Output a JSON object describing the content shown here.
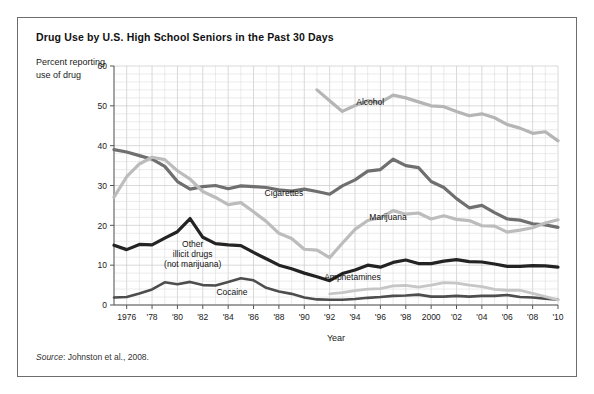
{
  "figure": {
    "title": "Drug Use by U.S. High School Seniors in the Past 30 Days",
    "y_caption": "Percent reporting use of drug",
    "source_prefix": "Source",
    "source_text": ": Johnston et al., 2008."
  },
  "chart_data": {
    "type": "line",
    "title": "Drug Use by U.S. High School Seniors in the Past 30 Days",
    "xlabel": "Year",
    "ylabel": "Percent reporting use of drug",
    "xlim": [
      1975,
      2010
    ],
    "ylim": [
      0,
      60
    ],
    "ytick_step": 10,
    "yticks": [
      0,
      10,
      20,
      30,
      40,
      50,
      60
    ],
    "xticks": [
      1976,
      1978,
      1980,
      1982,
      1984,
      1986,
      1988,
      1990,
      1992,
      1994,
      1996,
      1998,
      2000,
      2002,
      2004,
      2006,
      2008,
      2010
    ],
    "xtick_labels": [
      "1976",
      "'78",
      "'80",
      "'82",
      "'84",
      "'86",
      "'88",
      "'90",
      "'92",
      "'94",
      "'96",
      "'98",
      "2000",
      "'02",
      "'04",
      "'06",
      "'08",
      "'10"
    ],
    "grid": true,
    "grid_minor_x": true,
    "grid_minor_y": true,
    "legend": "inline-labels",
    "series": [
      {
        "name": "Alcohol",
        "color": "#b5b5b5",
        "width": 3.2,
        "label_x": 1995.2,
        "label_y": 50.2,
        "x": [
          1991,
          1992,
          1993,
          1994,
          1995,
          1996,
          1997,
          1998,
          1999,
          2000,
          2001,
          2002,
          2003,
          2004,
          2005,
          2006,
          2007,
          2008,
          2009,
          2010
        ],
        "values": [
          54.0,
          51.3,
          48.6,
          50.1,
          51.3,
          50.8,
          52.7,
          52.0,
          51.0,
          50.0,
          49.8,
          48.6,
          47.5,
          48.0,
          47.0,
          45.3,
          44.4,
          43.1,
          43.5,
          41.2
        ]
      },
      {
        "name": "Cigarettes",
        "color": "#6f6f6f",
        "width": 3.2,
        "label_x": 1988.4,
        "label_y": 27.4,
        "x": [
          1975,
          1976,
          1977,
          1978,
          1979,
          1980,
          1981,
          1982,
          1983,
          1984,
          1985,
          1986,
          1987,
          1988,
          1989,
          1990,
          1991,
          1992,
          1993,
          1994,
          1995,
          1996,
          1997,
          1998,
          1999,
          2000,
          2001,
          2002,
          2003,
          2004,
          2005,
          2006,
          2007,
          2008,
          2009,
          2010
        ],
        "values": [
          39.0,
          38.4,
          37.5,
          36.6,
          34.8,
          31.0,
          29.1,
          29.7,
          30.0,
          29.2,
          29.9,
          29.7,
          29.5,
          28.9,
          28.6,
          29.1,
          28.5,
          27.8,
          29.9,
          31.4,
          33.6,
          34.0,
          36.6,
          35.0,
          34.5,
          31.0,
          29.5,
          26.7,
          24.4,
          25.0,
          23.2,
          21.6,
          21.3,
          20.4,
          20.1,
          19.5
        ]
      },
      {
        "name": "Marijuana",
        "color": "#bcbcbc",
        "width": 3.2,
        "label_x": 1996.6,
        "label_y": 21.4,
        "x": [
          1975,
          1976,
          1977,
          1978,
          1979,
          1980,
          1981,
          1982,
          1983,
          1984,
          1985,
          1986,
          1987,
          1988,
          1989,
          1990,
          1991,
          1992,
          1993,
          1994,
          1995,
          1996,
          1997,
          1998,
          1999,
          2000,
          2001,
          2002,
          2003,
          2004,
          2005,
          2006,
          2007,
          2008,
          2009,
          2010
        ],
        "values": [
          27.1,
          32.2,
          35.4,
          37.1,
          36.5,
          33.7,
          31.6,
          28.5,
          27.0,
          25.2,
          25.7,
          23.4,
          21.0,
          18.0,
          16.7,
          14.0,
          13.8,
          11.9,
          15.5,
          19.0,
          21.2,
          21.9,
          23.7,
          22.8,
          23.1,
          21.6,
          22.4,
          21.5,
          21.2,
          19.9,
          19.8,
          18.3,
          18.8,
          19.4,
          20.6,
          21.4
        ]
      },
      {
        "name": "Other illicit drugs (not marijuana)",
        "color": "#232323",
        "width": 3.2,
        "label_x": 1981.2,
        "label_y": 14.6,
        "label_lines": [
          "Other",
          "illicit drugs",
          "(not marijuana)"
        ],
        "x": [
          1975,
          1976,
          1977,
          1978,
          1979,
          1980,
          1981,
          1982,
          1983,
          1984,
          1985,
          1986,
          1987,
          1988,
          1989,
          1990,
          1991,
          1992,
          1993,
          1994,
          1995,
          1996,
          1997,
          1998,
          1999,
          2000,
          2001,
          2002,
          2003,
          2004,
          2005,
          2006,
          2007,
          2008,
          2009,
          2010
        ],
        "values": [
          15.0,
          13.9,
          15.2,
          15.1,
          16.8,
          18.4,
          21.7,
          17.0,
          15.4,
          15.1,
          14.9,
          13.2,
          11.6,
          10.0,
          9.1,
          8.0,
          7.1,
          6.1,
          7.9,
          8.8,
          10.0,
          9.5,
          10.7,
          11.3,
          10.4,
          10.4,
          11.0,
          11.4,
          10.9,
          10.8,
          10.3,
          9.7,
          9.7,
          9.9,
          9.8,
          9.5
        ]
      },
      {
        "name": "Cocaine",
        "color": "#4d4d4d",
        "width": 2.6,
        "label_x": 1984.3,
        "label_y": 2.6,
        "x": [
          1975,
          1976,
          1977,
          1978,
          1979,
          1980,
          1981,
          1982,
          1983,
          1984,
          1985,
          1986,
          1987,
          1988,
          1989,
          1990,
          1991,
          1992,
          1993,
          1994,
          1995,
          1996,
          1997,
          1998,
          1999,
          2000,
          2001,
          2002,
          2003,
          2004,
          2005,
          2006,
          2007,
          2008,
          2009,
          2010
        ],
        "values": [
          1.9,
          2.0,
          2.9,
          3.9,
          5.7,
          5.2,
          5.8,
          5.0,
          4.9,
          5.8,
          6.7,
          6.2,
          4.3,
          3.4,
          2.8,
          1.9,
          1.4,
          1.3,
          1.3,
          1.5,
          1.8,
          2.0,
          2.3,
          2.4,
          2.6,
          2.1,
          2.1,
          2.3,
          2.1,
          2.3,
          2.3,
          2.5,
          2.0,
          1.9,
          1.6,
          1.3
        ]
      },
      {
        "name": "Amphetamines",
        "color": "#c6c6c6",
        "width": 2.8,
        "label_x": 1993.8,
        "label_y": 6.4,
        "x": [
          1992,
          1993,
          1994,
          1995,
          1996,
          1997,
          1998,
          1999,
          2000,
          2001,
          2002,
          2003,
          2004,
          2005,
          2006,
          2007,
          2008,
          2009,
          2010
        ],
        "values": [
          2.8,
          3.1,
          3.6,
          4.0,
          4.1,
          4.8,
          4.9,
          4.5,
          5.0,
          5.6,
          5.5,
          5.0,
          4.6,
          3.9,
          3.7,
          3.7,
          2.9,
          2.1,
          1.3
        ]
      }
    ]
  }
}
